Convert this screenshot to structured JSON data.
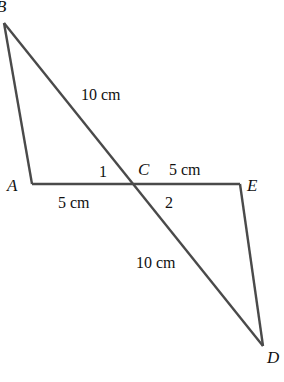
{
  "diagram": {
    "type": "geometry",
    "line_color": "#4a4a4a",
    "points": {
      "A": {
        "label": "A",
        "x": 32,
        "y": 184
      },
      "B": {
        "label": "B",
        "x": 4,
        "y": 23
      },
      "C": {
        "label": "C",
        "x": 134,
        "y": 184
      },
      "D": {
        "label": "D",
        "x": 263,
        "y": 346
      },
      "E": {
        "label": "E",
        "x": 240,
        "y": 184
      }
    },
    "segments": [
      "AB",
      "BD",
      "AE",
      "ED"
    ],
    "measurements": {
      "BC": "10 cm",
      "CE": "5 cm",
      "AC": "5 cm",
      "CD": "10 cm"
    },
    "angles": {
      "angle1": "1",
      "angle2": "2"
    }
  }
}
